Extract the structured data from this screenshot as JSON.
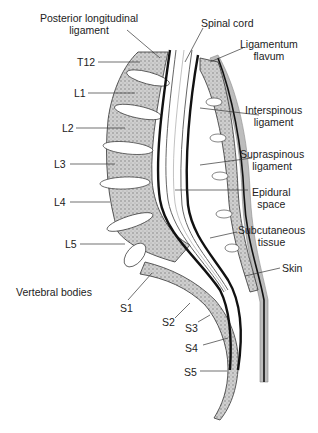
{
  "diagram": {
    "labels": {
      "posterior_longitudinal_ligament_1": "Posterior longitudinal",
      "posterior_longitudinal_ligament_2": "ligament",
      "spinal_cord": "Spinal cord",
      "ligamentum_flavum_1": "Ligamentum",
      "ligamentum_flavum_2": "flavum",
      "interspinous_ligament_1": "Interspinous",
      "interspinous_ligament_2": "ligament",
      "supraspinous_ligament_1": "Supraspinous",
      "supraspinous_ligament_2": "ligament",
      "epidural_space_1": "Epidural",
      "epidural_space_2": "space",
      "subcutaneous_tissue_1": "Subcutaneous",
      "subcutaneous_tissue_2": "tissue",
      "skin": "Skin",
      "vertebral_bodies": "Vertebral bodies"
    },
    "vertebrae": [
      "T12",
      "L1",
      "L2",
      "L3",
      "L4",
      "L5",
      "S1",
      "S2",
      "S3",
      "S4",
      "S5"
    ],
    "colors": {
      "bone_fill": "#c9c9c9",
      "disc_fill": "#ffffff",
      "outline": "#111111",
      "skin": "#bdbdbd",
      "text": "#222222"
    }
  }
}
